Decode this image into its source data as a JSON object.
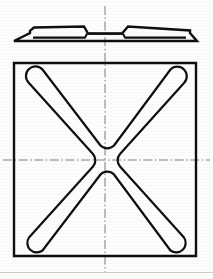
{
  "document": {
    "kind": "engineering-drawing",
    "title": "Stamped plate with X-shaped rib",
    "sheet_background": "#fdfdfc",
    "line_color": "#100f0d",
    "centerline_color": "#6e6e6e",
    "width_px": 213,
    "height_px": 279
  },
  "views": {
    "elevation": {
      "name": "front-elevation-view",
      "description": "Thin flat plate seen edge-on, two raised pads separated by a central notch",
      "bounds": {
        "x": 14,
        "y": 22,
        "width": 183,
        "height": 22
      },
      "baseline_y": 41,
      "plate_top_y": 26,
      "plate_thickness": 4,
      "left_pad": {
        "start_x": 30,
        "end_x": 88
      },
      "center_notch": {
        "start_x": 88,
        "end_x": 122,
        "depth": 9
      },
      "right_pad": {
        "start_x": 122,
        "end_x": 180
      },
      "left_flange_x": 14,
      "right_flange_x": 197
    },
    "plan": {
      "name": "plan-view",
      "description": "Square plate containing a rounded X-shaped rib meeting at a pinched centre",
      "square": {
        "x": 14,
        "y": 63,
        "width": 182,
        "height": 193
      },
      "rib": {
        "arm_width": 13,
        "end_radius": 7,
        "centre_pinch_radius": 9,
        "arm_end_inset": 14,
        "arm_count": 4
      }
    }
  },
  "centerlines": {
    "vertical": {
      "name": "vertical-centerline",
      "x": 105,
      "y1": 6,
      "y2": 272
    },
    "horizontal": {
      "name": "horizontal-centerline",
      "y": 160,
      "x1": 3,
      "x2": 210
    }
  },
  "annotations": {
    "labels": [],
    "dimensions": [],
    "notes": []
  },
  "palette": {
    "ink": "#100f0d",
    "construction": "#6e6e6e",
    "paper": "#fdfdfc",
    "faint_edge": "#c9c9c7"
  }
}
